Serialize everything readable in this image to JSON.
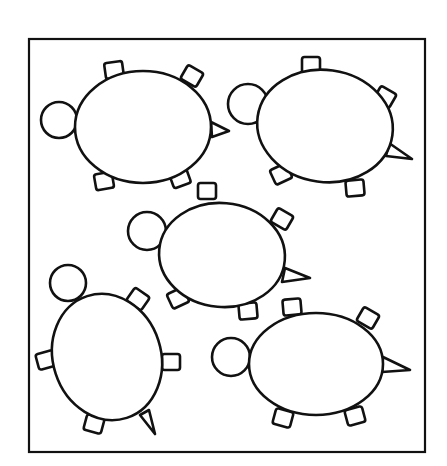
{
  "figure": {
    "description": "Line drawing of five turtles inside a square frame",
    "turtle_count": 5,
    "colors": {
      "line": "#111111",
      "background": "#ffffff"
    }
  },
  "frame": {
    "x": 29,
    "y": 39,
    "width": 396,
    "height": 413
  },
  "turtles": [
    {
      "name": "turtle-1",
      "shell": {
        "cx": 143,
        "cy": 127,
        "rx": 68,
        "ry": 56,
        "rot": 0
      },
      "head": {
        "cx": 59,
        "cy": 120,
        "r": 18
      },
      "legs": [
        {
          "x": 114,
          "y": 70,
          "rot": -8
        },
        {
          "x": 192,
          "y": 76,
          "rot": 30
        },
        {
          "x": 104,
          "y": 181,
          "rot": -10
        },
        {
          "x": 180,
          "y": 178,
          "rot": -20
        }
      ],
      "tail": {
        "bx1": 211,
        "by1": 122,
        "bx2": 212,
        "by2": 137,
        "tx": 229,
        "ty": 131
      }
    },
    {
      "name": "turtle-2",
      "shell": {
        "cx": 325,
        "cy": 126,
        "rx": 68,
        "ry": 56,
        "rot": 8
      },
      "head": {
        "cx": 248,
        "cy": 104,
        "r": 20
      },
      "legs": [
        {
          "x": 311,
          "y": 65,
          "rot": 0
        },
        {
          "x": 385,
          "y": 97,
          "rot": 30
        },
        {
          "x": 281,
          "y": 174,
          "rot": -25
        },
        {
          "x": 355,
          "y": 188,
          "rot": -5
        }
      ],
      "tail": {
        "bx1": 389,
        "by1": 143,
        "bx2": 386,
        "by2": 156,
        "tx": 412,
        "ty": 159
      }
    },
    {
      "name": "turtle-3",
      "shell": {
        "cx": 222,
        "cy": 255,
        "rx": 63,
        "ry": 52,
        "rot": 5
      },
      "head": {
        "cx": 147,
        "cy": 231,
        "r": 19
      },
      "legs": [
        {
          "x": 207,
          "y": 191,
          "rot": 0
        },
        {
          "x": 282,
          "y": 219,
          "rot": 30
        },
        {
          "x": 178,
          "y": 298,
          "rot": -25
        },
        {
          "x": 248,
          "y": 311,
          "rot": -5
        }
      ],
      "tail": {
        "bx1": 285,
        "by1": 268,
        "bx2": 282,
        "by2": 282,
        "tx": 310,
        "ty": 278
      }
    },
    {
      "name": "turtle-4",
      "shell": {
        "cx": 107,
        "cy": 357,
        "rx": 54,
        "ry": 64,
        "rot": -18
      },
      "head": {
        "cx": 68,
        "cy": 283,
        "r": 18
      },
      "legs": [
        {
          "x": 138,
          "y": 299,
          "rot": 35
        },
        {
          "x": 46,
          "y": 360,
          "rot": -15
        },
        {
          "x": 171,
          "y": 362,
          "rot": 0
        },
        {
          "x": 94,
          "y": 424,
          "rot": 15
        }
      ],
      "tail": {
        "bx1": 140,
        "by1": 415,
        "bx2": 149,
        "by2": 410,
        "tx": 155,
        "ty": 434
      }
    },
    {
      "name": "turtle-5",
      "shell": {
        "cx": 316,
        "cy": 364,
        "rx": 67,
        "ry": 51,
        "rot": 0
      },
      "head": {
        "cx": 231,
        "cy": 357,
        "r": 19
      },
      "legs": [
        {
          "x": 292,
          "y": 307,
          "rot": -5
        },
        {
          "x": 368,
          "y": 318,
          "rot": 30
        },
        {
          "x": 283,
          "y": 418,
          "rot": 15
        },
        {
          "x": 355,
          "y": 416,
          "rot": -15
        }
      ],
      "tail": {
        "bx1": 383,
        "by1": 357,
        "bx2": 382,
        "by2": 372,
        "tx": 410,
        "ty": 370
      }
    }
  ]
}
